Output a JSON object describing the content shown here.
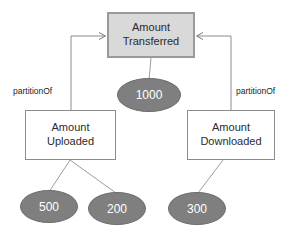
{
  "diagram": {
    "type": "node-link-graph",
    "colors": {
      "root_box_fill": "#d9d9d9",
      "root_box_border": "#9a9a9a",
      "child_box_fill": "#ffffff",
      "child_box_border": "#8c8c8c",
      "ellipse_fill": "#7f7f7f",
      "ellipse_border": "#6e6e6e",
      "ellipse_text": "#ffffff",
      "edge_stroke": "#8c8c8c",
      "arrow_stroke": "#7a7a7a",
      "background": "#ffffff"
    },
    "nodes": {
      "root": {
        "id": "amount-transferred",
        "line1": "Amount",
        "line2": "Transferred",
        "shape": "rectangle",
        "x": 107,
        "y": 12,
        "w": 88,
        "h": 46
      },
      "left": {
        "id": "amount-uploaded",
        "line1": "Amount",
        "line2": "Uploaded",
        "shape": "rectangle",
        "x": 25,
        "y": 110,
        "w": 91,
        "h": 50
      },
      "right": {
        "id": "amount-downloaded",
        "line1": "Amount",
        "line2": "Downloaded",
        "shape": "rectangle",
        "x": 187,
        "y": 110,
        "w": 88,
        "h": 50
      }
    },
    "values": {
      "root_value": "1000",
      "upload_value_1": "500",
      "upload_value_2": "200",
      "download_value": "300"
    },
    "value_nodes": [
      {
        "id": "value-1000",
        "label": "1000",
        "parent": "amount-transferred",
        "x": 117,
        "y": 78,
        "w": 64,
        "h": 34
      },
      {
        "id": "value-500",
        "label": "500",
        "parent": "amount-uploaded",
        "x": 20,
        "y": 190,
        "w": 58,
        "h": 33
      },
      {
        "id": "value-200",
        "label": "200",
        "parent": "amount-uploaded",
        "x": 88,
        "y": 192,
        "w": 58,
        "h": 33
      },
      {
        "id": "value-300",
        "label": "300",
        "parent": "amount-downloaded",
        "x": 168,
        "y": 192,
        "w": 58,
        "h": 33
      }
    ],
    "edge_labels": {
      "left_partition": "partitionOf",
      "right_partition": "partitionOf"
    },
    "relations": [
      {
        "from": "amount-uploaded",
        "to": "amount-transferred",
        "label": "partitionOf",
        "arrow": true
      },
      {
        "from": "amount-downloaded",
        "to": "amount-transferred",
        "label": "partitionOf",
        "arrow": true
      },
      {
        "from": "amount-transferred",
        "to": "value-1000",
        "label": "",
        "arrow": false
      },
      {
        "from": "amount-uploaded",
        "to": "value-500",
        "label": "",
        "arrow": false
      },
      {
        "from": "amount-uploaded",
        "to": "value-200",
        "label": "",
        "arrow": false
      },
      {
        "from": "amount-downloaded",
        "to": "value-300",
        "label": "",
        "arrow": false
      }
    ]
  }
}
